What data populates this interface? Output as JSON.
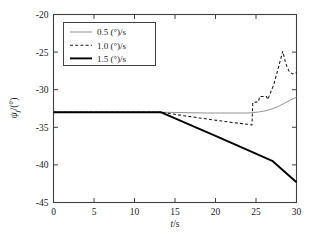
{
  "chart_data": {
    "type": "line",
    "title": "",
    "xlabel": "t/s",
    "ylabel": "ψf/(°)",
    "xlim": [
      0,
      30
    ],
    "ylim": [
      -45,
      -20
    ],
    "xticks": [
      0,
      5,
      10,
      15,
      20,
      25,
      30
    ],
    "xtick_labels": [
      "0",
      "5",
      "10",
      "15",
      "20",
      "25",
      "30"
    ],
    "yticks": [
      -45,
      -40,
      -35,
      -30,
      -25,
      -20
    ],
    "ytick_labels": [
      "-45",
      "-40",
      "-35",
      "-30",
      "-25",
      "-20"
    ],
    "grid": false,
    "legend_position": "upper left",
    "series": [
      {
        "name": "0.5 (°)/s",
        "style": "solid-thin",
        "color": "#8c8c8c",
        "x": [
          0,
          5,
          10,
          13.3,
          16,
          19,
          22,
          24.0,
          24.6,
          25.4,
          26.2,
          27.0,
          27.8,
          28.5,
          29.2,
          30
        ],
        "y": [
          -33.0,
          -33.0,
          -33.0,
          -33.0,
          -33.05,
          -33.1,
          -33.1,
          -33.1,
          -33.05,
          -32.95,
          -32.8,
          -32.55,
          -32.2,
          -31.8,
          -31.4,
          -31.0
        ]
      },
      {
        "name": "1.0 (°)/s",
        "style": "dashed",
        "color": "#1a1a1a",
        "x": [
          0,
          5,
          10,
          13.3,
          16,
          18,
          20,
          22,
          24.0,
          24.5,
          24.6,
          25.3,
          25.45,
          26.3,
          26.45,
          27.2,
          28.3,
          28.7,
          29.1,
          29.5,
          30
        ],
        "y": [
          -33.0,
          -33.0,
          -33.0,
          -33.0,
          -33.45,
          -33.75,
          -34.05,
          -34.35,
          -34.6,
          -34.7,
          -31.7,
          -31.6,
          -30.9,
          -30.9,
          -31.3,
          -29.3,
          -24.9,
          -26.6,
          -27.6,
          -27.9,
          -27.7
        ]
      },
      {
        "name": "1.5 (°)/s",
        "style": "solid-thick",
        "color": "#000000",
        "x": [
          0,
          5,
          10,
          13.3,
          17,
          20,
          24,
          27,
          30
        ],
        "y": [
          -33.0,
          -33.0,
          -33.0,
          -33.0,
          -34.75,
          -36.15,
          -38.05,
          -39.45,
          -42.3
        ]
      }
    ]
  },
  "axes": {
    "x_axis_title": "t/s",
    "y_axis_symbol": "ψ",
    "y_axis_subscript": "f",
    "y_axis_units": "/(°)"
  },
  "legend": {
    "entries": [
      {
        "label": "0.5 (°)/s"
      },
      {
        "label": "1.0 (°)/s"
      },
      {
        "label": "1.5 (°)/s"
      }
    ]
  }
}
